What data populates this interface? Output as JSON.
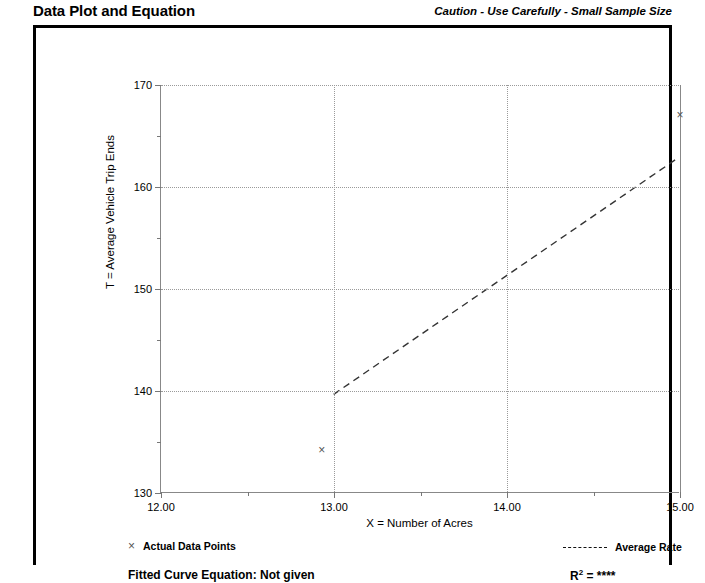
{
  "header": {
    "title": "Data Plot and Equation",
    "caution": "Caution - Use Carefully - Small Sample Size"
  },
  "legend": {
    "actual_marker": "×",
    "actual_label": "Actual Data Points",
    "average_label": "Average Rate"
  },
  "footer": {
    "equation_label": "Fitted Curve Equation:  Not given",
    "r_squared_prefix": "R",
    "r_squared_exp": "2",
    "r_squared_value": "= ****"
  },
  "chart_data": {
    "type": "scatter",
    "title": "Data Plot and Equation",
    "xlabel": "X = Number of Acres",
    "ylabel": "T = Average Vehicle Trip Ends",
    "xlim": [
      12.0,
      15.0
    ],
    "ylim": [
      130,
      170
    ],
    "xticks": [
      12.0,
      13.0,
      14.0,
      15.0
    ],
    "xtick_labels": [
      "12.00",
      "13.00",
      "14.00",
      "15.00"
    ],
    "xticks_minor": [
      12.5,
      13.5,
      14.5
    ],
    "yticks": [
      130,
      140,
      150,
      160,
      170
    ],
    "ytick_labels": [
      "130",
      "140",
      "150",
      "160",
      "170"
    ],
    "yticks_minor": [
      135,
      145,
      155,
      165
    ],
    "grid": true,
    "legend_position": "below-axes",
    "series": [
      {
        "name": "Actual Data Points",
        "type": "scatter",
        "marker": "x",
        "color": "#555555",
        "points": [
          {
            "x": 12.93,
            "y": 134.2
          },
          {
            "x": 15.0,
            "y": 167.0
          }
        ]
      },
      {
        "name": "Average Rate",
        "type": "line",
        "style": "dashed",
        "color": "#333333",
        "points": [
          {
            "x": 13.0,
            "y": 139.6
          },
          {
            "x": 15.0,
            "y": 162.9
          }
        ]
      }
    ]
  }
}
